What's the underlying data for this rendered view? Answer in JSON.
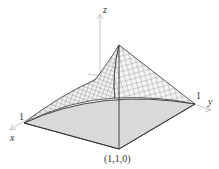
{
  "figure": {
    "type": "3d-surface-plot",
    "axes": {
      "x_label": "x",
      "y_label": "y",
      "z_label": "z"
    },
    "tick_labels": {
      "x_one": "1",
      "y_one": "1"
    },
    "point_label": "(1,1,0)",
    "colors": {
      "mesh": "#555555",
      "base": "#d9d9d9",
      "axis": "#b0b0b0",
      "edge": "#333333"
    }
  }
}
